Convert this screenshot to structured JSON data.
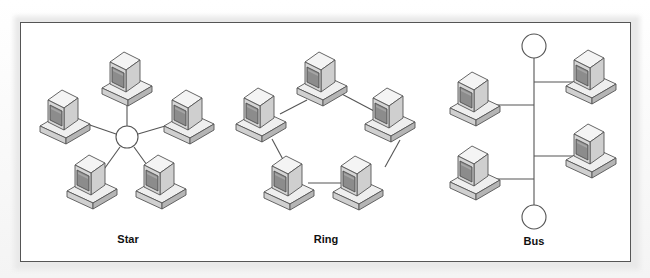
{
  "diagram": {
    "colors": {
      "line": "#555555",
      "border": "#555555",
      "monitor_top": "#f2f2f2",
      "monitor_side": "#d4d4d4",
      "bezel": "#c8c8c8",
      "screen": "#8c8c8c",
      "base_top": "#efefef",
      "base_side": "#bdbdbd"
    },
    "topologies": [
      {
        "name": "Star",
        "label_pos": [
          128,
          232
        ],
        "hub": {
          "cx": 127,
          "cy": 137,
          "r": 11
        },
        "computers": [
          [
            128,
            82
          ],
          [
            66,
            120
          ],
          [
            190,
            120
          ],
          [
            93,
            185
          ],
          [
            162,
            185
          ]
        ],
        "links": [
          [
            127,
            126,
            127,
            100
          ],
          [
            116,
            134,
            85,
            123
          ],
          [
            138,
            134,
            172,
            124
          ],
          [
            120,
            147,
            100,
            172
          ],
          [
            134,
            147,
            153,
            172
          ]
        ]
      },
      {
        "name": "Ring",
        "label_pos": [
          326,
          232
        ],
        "computers": [
          [
            323,
            82
          ],
          [
            262,
            118
          ],
          [
            391,
            118
          ],
          [
            290,
            186
          ],
          [
            359,
            186
          ]
        ],
        "links": [
          [
            340,
            93,
            374,
            112
          ],
          [
            280,
            113,
            306,
            99
          ],
          [
            272,
            138,
            288,
            166
          ],
          [
            400,
            140,
            384,
            167
          ],
          [
            309,
            182,
            341,
            182
          ]
        ]
      },
      {
        "name": "Bus",
        "label_pos": [
          534,
          238
        ],
        "terminators": [
          {
            "cx": 534,
            "cy": 46,
            "r": 12
          },
          {
            "cx": 534,
            "cy": 217,
            "r": 12
          }
        ],
        "backbone": [
          534,
          58,
          534,
          205
        ],
        "computers": [
          [
            474,
            100
          ],
          [
            617,
            83
          ],
          [
            474,
            175
          ],
          [
            617,
            158
          ]
        ],
        "links": [
          [
            492,
            105,
            534,
            105
          ],
          [
            534,
            82,
            573,
            82
          ],
          [
            492,
            178,
            534,
            178
          ],
          [
            534,
            157,
            573,
            157
          ]
        ]
      }
    ]
  }
}
